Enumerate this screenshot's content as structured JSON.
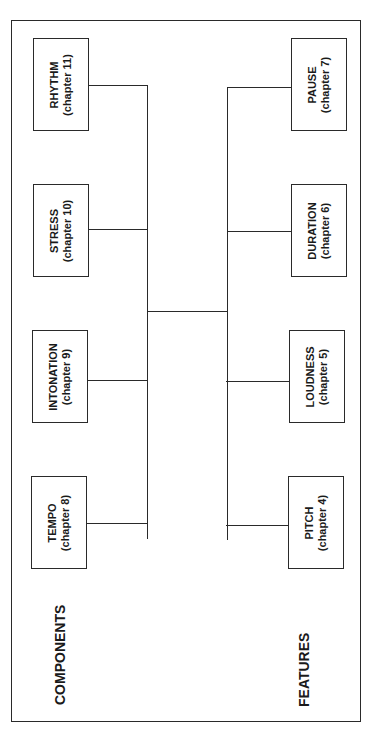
{
  "diagram": {
    "components_label": "COMPONENTS",
    "features_label": "FEATURES",
    "components": [
      {
        "name": "RHYTHM",
        "chapter": "(chapter 11)"
      },
      {
        "name": "STRESS",
        "chapter": "(chapter 10)"
      },
      {
        "name": "INTONATION",
        "chapter": "(chapter 9)"
      },
      {
        "name": "TEMPO",
        "chapter": "(chapter 8)"
      }
    ],
    "features": [
      {
        "name": "PAUSE",
        "chapter": "(chapter 7)"
      },
      {
        "name": "DURATION",
        "chapter": "(chapter 6)"
      },
      {
        "name": "LOUDNESS",
        "chapter": "(chapter 5)"
      },
      {
        "name": "PITCH",
        "chapter": "(chapter 4)"
      }
    ]
  }
}
